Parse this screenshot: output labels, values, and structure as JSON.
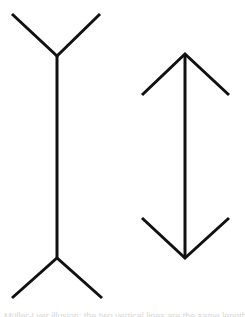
{
  "figure": {
    "title": "Müller-Lyer illusion",
    "stroke_color": "#111111",
    "background_color": "#ffffff",
    "stroke_width": 3,
    "left_figure": {
      "name": "fins-out line",
      "shaft": {
        "x1": 57,
        "y1": 56,
        "x2": 57,
        "y2": 258
      },
      "top_fin": {
        "left": [
          12,
          14
        ],
        "vertex": [
          57,
          56
        ],
        "right": [
          100,
          14
        ]
      },
      "bottom_fin": {
        "left": [
          12,
          298
        ],
        "vertex": [
          57,
          258
        ],
        "right": [
          102,
          298
        ]
      }
    },
    "right_figure": {
      "name": "fins-in line (double-headed arrow)",
      "shaft": {
        "x1": 185,
        "y1": 54,
        "x2": 185,
        "y2": 258
      },
      "top_head": {
        "left": [
          142,
          95
        ],
        "apex": [
          185,
          54
        ],
        "right": [
          229,
          95
        ]
      },
      "bottom_head": {
        "left": [
          142,
          218
        ],
        "apex": [
          185,
          258
        ],
        "right": [
          229,
          218
        ]
      }
    }
  },
  "caption": {
    "text": "Müller-Lyer illusion: the two vertical lines are the same length. The"
  }
}
